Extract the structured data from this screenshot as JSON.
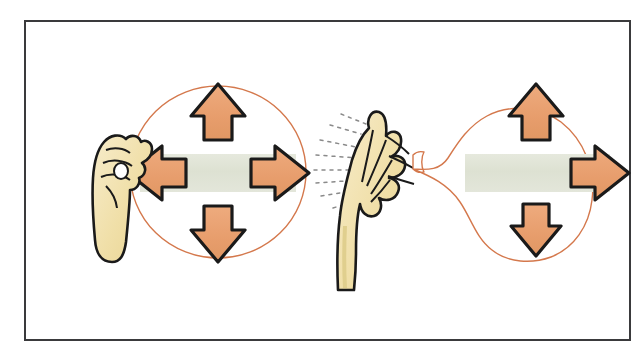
{
  "figure": {
    "caption": "Left: inflated balloon held closed, forces balanced in all directions. Right: balloon released, air escapes backward and the balloon is pushed forward.",
    "frame": {
      "border_color": "#3a3a3c",
      "background_color": "#ffffff"
    },
    "colors": {
      "arrow_fill": "#e9a172",
      "arrow_outline": "#1a1a1a",
      "pressure_bar": "#dfe2d4",
      "balloon_outline": "#d4784c",
      "skin_fill": "#f2e2b0",
      "ink_outline": "#1a1a1a",
      "air_jet": "#8a8a8a"
    }
  },
  "panels": [
    {
      "id": "closed-balloon",
      "name": "balloon-held-closed",
      "label": "Balloon sealed by hand",
      "balloon_shape": "round",
      "arrows": [
        {
          "direction": "up",
          "name": "force-arrow-up"
        },
        {
          "direction": "down",
          "name": "force-arrow-down"
        },
        {
          "direction": "left",
          "name": "force-arrow-left"
        },
        {
          "direction": "right",
          "name": "force-arrow-right"
        }
      ],
      "net_force": "balanced",
      "hand": {
        "name": "hand-pinching-neck",
        "pose": "closed fist pinching balloon neck",
        "side": "left"
      },
      "air_escaping": false
    },
    {
      "id": "released-balloon",
      "name": "balloon-released",
      "label": "Balloon released, air escaping",
      "balloon_shape": "round with open neck",
      "arrows": [
        {
          "direction": "up",
          "name": "force-arrow-up"
        },
        {
          "direction": "down",
          "name": "force-arrow-down"
        },
        {
          "direction": "right",
          "name": "thrust-arrow-right"
        }
      ],
      "net_force": "rightward",
      "hand": {
        "name": "hand-releasing-neck",
        "pose": "open hand letting go of balloon neck",
        "side": "right"
      },
      "air_escaping": true,
      "air_jet_direction": "left",
      "air_jet_line_count": 8
    }
  ]
}
